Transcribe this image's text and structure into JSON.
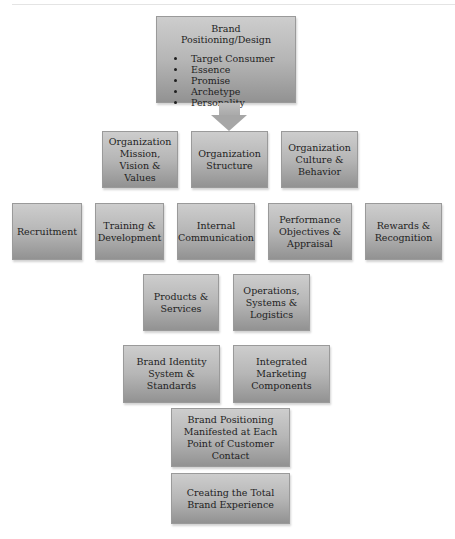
{
  "diagram": {
    "top": {
      "title": "Brand Positioning/Design",
      "bullets": [
        "Target Consumer",
        "Essence",
        "Promise",
        "Archetype",
        "Personality"
      ]
    },
    "row2": [
      "Organization Mission, Vision & Values",
      "Organization Structure",
      "Organization Culture & Behavior"
    ],
    "row3": [
      "Recruitment",
      "Training & Development",
      "Internal Communication",
      "Performance Objectives & Appraisal",
      "Rewards & Recognition"
    ],
    "row4": [
      "Products & Services",
      "Operations, Systems & Logistics"
    ],
    "row5": [
      "Brand Identity System & Standards",
      "Integrated Marketing Components"
    ],
    "row6": "Brand Positioning Manifested at Each Point of Customer Contact",
    "row7": "Creating the Total Brand Experience"
  },
  "colors": {
    "box_top": "#cdcdcd",
    "box_bottom": "#929292",
    "arrow": "#a6a6a6",
    "text": "#1e1e1e"
  }
}
